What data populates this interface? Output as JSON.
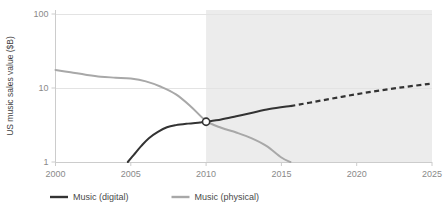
{
  "chart_data": {
    "type": "line",
    "title": "",
    "xlabel": "",
    "ylabel": "US music sales value ($B)",
    "yscale": "log",
    "ylim": [
      1,
      100
    ],
    "xlim": [
      2000,
      2025
    ],
    "ytick_labels": [
      "100",
      "10",
      "1"
    ],
    "ytick_values": [
      100,
      10,
      1
    ],
    "xtick_labels": [
      "2000",
      "2005",
      "2010",
      "2015",
      "2020",
      "2025"
    ],
    "xtick_values": [
      2000,
      2005,
      2010,
      2015,
      2020,
      2025
    ],
    "grid": "horizontal-only",
    "legend_position": "bottom-left",
    "forecast_shading": {
      "from": 2010,
      "to": 2025,
      "color": "#ececec"
    },
    "crossover_marker": {
      "x": 2010,
      "y": 3.5,
      "fill": "#ffffff",
      "stroke": "#333333"
    },
    "series": [
      {
        "name": "Music (digital)",
        "color": "#333333",
        "solid_until": 2015.6,
        "dashed_after": true,
        "points": [
          [
            2004.8,
            1.0
          ],
          [
            2005.2,
            1.25
          ],
          [
            2005.7,
            1.65
          ],
          [
            2006.2,
            2.1
          ],
          [
            2006.8,
            2.55
          ],
          [
            2007.4,
            2.95
          ],
          [
            2008.0,
            3.15
          ],
          [
            2008.8,
            3.3
          ],
          [
            2009.6,
            3.42
          ],
          [
            2010.0,
            3.5
          ],
          [
            2011.0,
            3.75
          ],
          [
            2012.0,
            4.15
          ],
          [
            2013.0,
            4.6
          ],
          [
            2014.2,
            5.2
          ],
          [
            2015.6,
            5.7
          ],
          [
            2017.0,
            6.4
          ],
          [
            2019.0,
            7.6
          ],
          [
            2021.0,
            8.9
          ],
          [
            2023.0,
            10.2
          ],
          [
            2025.0,
            11.5
          ]
        ]
      },
      {
        "name": "Music (physical)",
        "color": "#a8a8a8",
        "solid_until": 2025,
        "dashed_after": false,
        "points": [
          [
            2000.0,
            17.5
          ],
          [
            2001.0,
            16.3
          ],
          [
            2002.0,
            15.1
          ],
          [
            2003.0,
            14.2
          ],
          [
            2004.0,
            13.8
          ],
          [
            2005.0,
            13.4
          ],
          [
            2006.0,
            12.3
          ],
          [
            2007.0,
            10.4
          ],
          [
            2008.0,
            8.2
          ],
          [
            2009.0,
            5.6
          ],
          [
            2010.0,
            3.6
          ],
          [
            2011.0,
            2.9
          ],
          [
            2012.0,
            2.5
          ],
          [
            2013.0,
            2.1
          ],
          [
            2014.0,
            1.65
          ],
          [
            2015.0,
            1.15
          ],
          [
            2015.6,
            1.0
          ]
        ]
      }
    ],
    "legend": [
      {
        "label": "Music (digital)",
        "color": "#333333"
      },
      {
        "label": "Music (physical)",
        "color": "#a8a8a8"
      }
    ]
  }
}
